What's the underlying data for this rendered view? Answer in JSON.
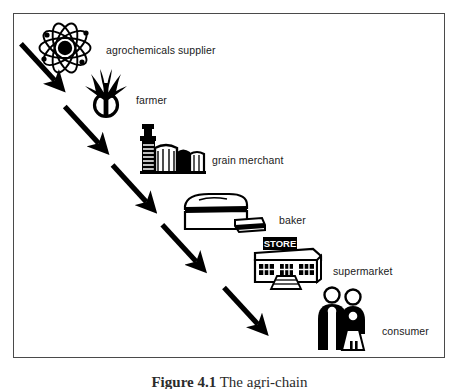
{
  "figure": {
    "caption_number": "Figure 4.1",
    "caption_text": "The agri-chain",
    "border_color": "#4a4a4a",
    "background_color": "#ffffff",
    "ink_color": "#000000"
  },
  "diagram": {
    "type": "flow-chain",
    "direction": "top-left to bottom-right",
    "arrow_count": 5,
    "stages": [
      {
        "id": "agrochemicals-supplier",
        "label": "agrochemicals supplier",
        "icon": "atom-icon"
      },
      {
        "id": "farmer",
        "label": "farmer",
        "icon": "plant-sprout-icon"
      },
      {
        "id": "grain-merchant",
        "label": "grain merchant",
        "icon": "grain-elevator-icon"
      },
      {
        "id": "baker",
        "label": "baker",
        "icon": "bread-loaf-icon"
      },
      {
        "id": "supermarket",
        "label": "supermarket",
        "icon": "store-building-icon",
        "sign_text": "STORE"
      },
      {
        "id": "consumer",
        "label": "consumer",
        "icon": "two-people-icon"
      }
    ]
  }
}
